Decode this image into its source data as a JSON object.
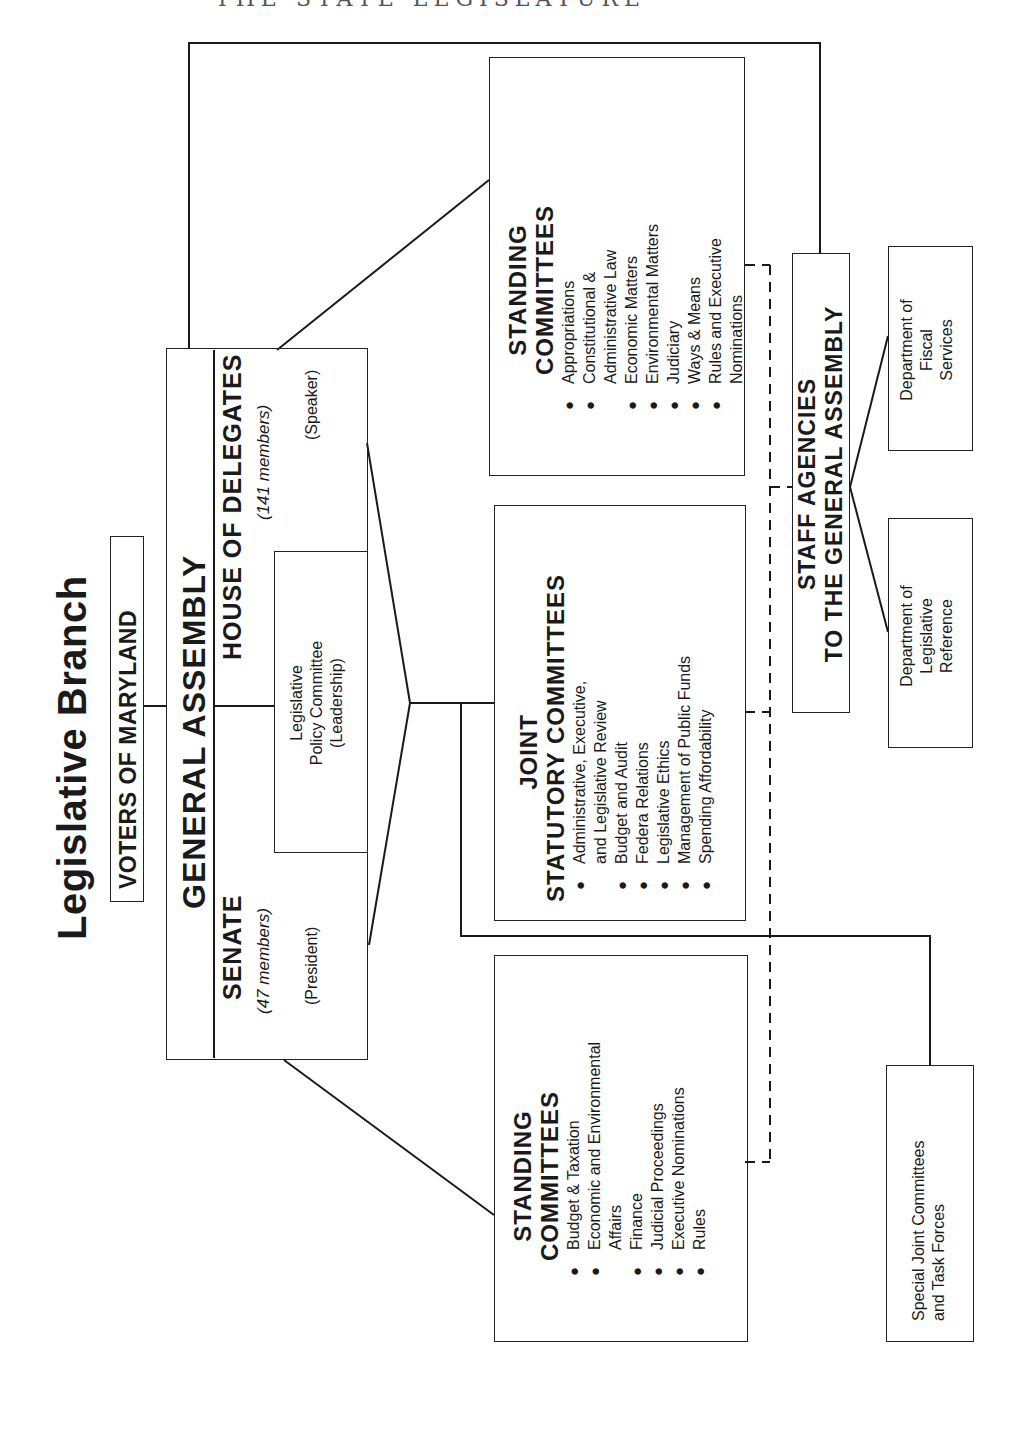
{
  "page_header": "THE STATE LEGISLATURE",
  "title": "Legislative Branch",
  "voters": {
    "label": "VOTERS OF MARYLAND"
  },
  "general_assembly": {
    "label": "GENERAL ASSEMBLY",
    "senate": {
      "name": "SENATE",
      "members": "(47 members)",
      "presiding": "(President)"
    },
    "house": {
      "name": "HOUSE OF DELEGATES",
      "members": "(141 members)",
      "presiding": "(Speaker)"
    },
    "policy_committee": {
      "line1": "Legislative",
      "line2": "Policy Committee",
      "line3": "(Leadership)"
    }
  },
  "house_standing_committees": {
    "title_line1": "STANDING",
    "title_line2": "COMMITTEES",
    "items": [
      {
        "text": "Appropriations",
        "bullet": true
      },
      {
        "text": "Constitutional &",
        "bullet": true
      },
      {
        "text": "Administrative Law",
        "bullet": false
      },
      {
        "text": "Economic Matters",
        "bullet": true
      },
      {
        "text": "Environmental Matters",
        "bullet": true
      },
      {
        "text": "Judiciary",
        "bullet": true
      },
      {
        "text": "Ways & Means",
        "bullet": true
      },
      {
        "text": "Rules and Executive",
        "bullet": true
      },
      {
        "text": "Nominations",
        "bullet": false
      }
    ]
  },
  "joint_statutory_committees": {
    "title_line1": "JOINT",
    "title_line2": "STATUTORY COMMITTEES",
    "items": [
      {
        "text": "Administrative, Executive,",
        "bullet": true
      },
      {
        "text": "and Legislative Review",
        "bullet": false
      },
      {
        "text": "Budget and Audit",
        "bullet": true
      },
      {
        "text": "Federa  Relations",
        "bullet": true
      },
      {
        "text": "Legislative Ethics",
        "bullet": true
      },
      {
        "text": "Management of Public Funds",
        "bullet": true
      },
      {
        "text": "Spending Affordability",
        "bullet": true
      }
    ]
  },
  "senate_standing_committees": {
    "title_line1": "STANDING",
    "title_line2": "COMMITTEES",
    "items": [
      {
        "text": "Budget & Taxation",
        "bullet": true
      },
      {
        "text": "Economic and Environmental",
        "bullet": true
      },
      {
        "text": "Affairs",
        "bullet": false
      },
      {
        "text": "Finance",
        "bullet": true
      },
      {
        "text": "Judicial Proceedings",
        "bullet": true
      },
      {
        "text": "Executive Nominations",
        "bullet": true
      },
      {
        "text": "Rules",
        "bullet": true
      }
    ]
  },
  "staff_agencies": {
    "title_line1": "STAFF AGENCIES",
    "title_line2": "TO THE GENERAL ASSEMBLY",
    "fiscal_services": {
      "line1": "Department of",
      "line2": "Fiscal",
      "line3": "Services"
    },
    "legislative_reference": {
      "line1": "Department of",
      "line2": "Legislative",
      "line3": "Reference"
    }
  },
  "special_joint": {
    "line1": "Special Joint Committees",
    "line2": "and Task Forces"
  }
}
